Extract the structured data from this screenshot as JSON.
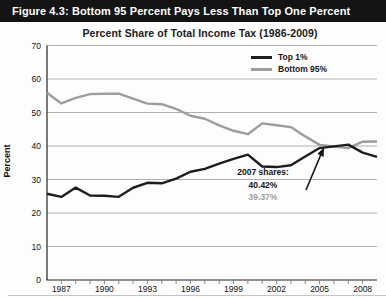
{
  "figure": {
    "header": "Figure 4.3: Bottom 95 Percent Pays Less Than Top One Percent",
    "title": "Percent Share of Total Income Tax (1986-2009)"
  },
  "annotation": {
    "title": "2007 shares:",
    "top1_value": "40.42%",
    "bottom95_value": "39.37%"
  },
  "colors": {
    "header_bg": "#141414",
    "top1_line": "#1d1d1d",
    "bottom95_line": "#9d9d9d",
    "gridline": "#999999",
    "axis": "#222222"
  },
  "chart_data": {
    "type": "line",
    "title": "Percent Share of Total Income Tax (1986-2009)",
    "xlabel": "",
    "ylabel": "Percent",
    "ylim": [
      0,
      70
    ],
    "grid": true,
    "legend_position": "top-right",
    "yticks": [
      0,
      10,
      20,
      30,
      40,
      50,
      60,
      70
    ],
    "x": [
      1986,
      1987,
      1988,
      1989,
      1990,
      1991,
      1992,
      1993,
      1994,
      1995,
      1996,
      1997,
      1998,
      1999,
      2000,
      2001,
      2002,
      2003,
      2004,
      2005,
      2006,
      2007,
      2008,
      2009
    ],
    "xtick_labels": [
      1987,
      1990,
      1993,
      1996,
      1999,
      2002,
      2005,
      2008
    ],
    "series": [
      {
        "name": "Top 1%",
        "color": "#1d1d1d",
        "values": [
          25.75,
          24.81,
          27.58,
          25.24,
          25.13,
          24.82,
          27.54,
          29.01,
          28.86,
          30.26,
          32.31,
          33.17,
          34.75,
          36.18,
          37.42,
          33.89,
          33.71,
          34.27,
          36.89,
          39.38,
          39.89,
          40.42,
          38.02,
          36.73
        ]
      },
      {
        "name": "Bottom 95%",
        "color": "#9d9d9d",
        "values": [
          55.9,
          52.7,
          54.38,
          55.5,
          55.6,
          55.6,
          54.12,
          52.64,
          52.48,
          51.09,
          49.03,
          48.13,
          46.16,
          44.55,
          43.53,
          46.75,
          46.2,
          45.64,
          42.87,
          40.33,
          39.86,
          39.37,
          41.28,
          41.34
        ]
      }
    ],
    "annotation": {
      "label": "2007 shares:",
      "year": 2007,
      "top1": 40.42,
      "bottom95": 39.37
    }
  }
}
